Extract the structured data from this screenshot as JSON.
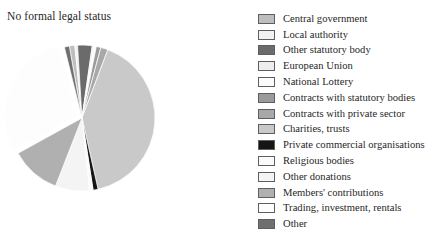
{
  "chart_data": {
    "type": "pie",
    "title": "No formal legal status",
    "xlabel": "",
    "ylabel": "",
    "legend_position": "right",
    "grid": false,
    "categories": [
      "Central government",
      "Local authority",
      "Other statutory body",
      "European Union",
      "National Lottery",
      "Contracts with statutory bodies",
      "Contracts with private sector",
      "Charities, trusts",
      "Private commercial organisations",
      "Religious bodies",
      "Other donations",
      "Members' contributions",
      "Trading, investment, rentals",
      "Other"
    ],
    "colors": [
      "#bdbdbd",
      "#f2f2f2",
      "#6b6b6b",
      "#ededed",
      "#fbfbfb",
      "#9a9a9a",
      "#a8a8a8",
      "#c9c9c9",
      "#151515",
      "#fafafa",
      "#f4f4f4",
      "#b0b0b0",
      "#fdfdfd",
      "#6f6f6f"
    ],
    "values": [
      1.2,
      0.6,
      3.2,
      0.4,
      0.5,
      1.0,
      1.6,
      40.5,
      1.1,
      0.8,
      7.5,
      11.0,
      29.0,
      1.1
    ],
    "exploded_slices": [
      "Trading, investment, rentals"
    ]
  },
  "legend": {
    "items": [
      {
        "label": "Central government",
        "color": "#bdbdbd"
      },
      {
        "label": "Local authority",
        "color": "#f2f2f2"
      },
      {
        "label": "Other statutory body",
        "color": "#6b6b6b"
      },
      {
        "label": "European Union",
        "color": "#ededed"
      },
      {
        "label": "National Lottery",
        "color": "#fbfbfb"
      },
      {
        "label": "Contracts with statutory bodies",
        "color": "#9a9a9a"
      },
      {
        "label": "Contracts with private sector",
        "color": "#a8a8a8"
      },
      {
        "label": "Charities, trusts",
        "color": "#c9c9c9"
      },
      {
        "label": "Private commercial organisations",
        "color": "#151515"
      },
      {
        "label": "Religious bodies",
        "color": "#fafafa"
      },
      {
        "label": "Other donations",
        "color": "#f4f4f4"
      },
      {
        "label": "Members' contributions",
        "color": "#b0b0b0"
      },
      {
        "label": "Trading, investment, rentals",
        "color": "#fdfdfd"
      },
      {
        "label": "Other",
        "color": "#6f6f6f"
      }
    ]
  }
}
